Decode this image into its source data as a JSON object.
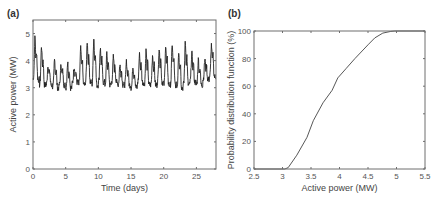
{
  "chart_data": [
    {
      "id": "a",
      "panel_label": "(a)",
      "type": "line",
      "title": "",
      "xlabel": "Time (days)",
      "ylabel": "Active power (MW)",
      "xlim": [
        0,
        28
      ],
      "ylim": [
        0,
        5.5
      ],
      "xticks": [
        0,
        5,
        10,
        15,
        20,
        25
      ],
      "xtick_labels": [
        "0",
        "5",
        "10",
        "15",
        "20",
        "25"
      ],
      "yticks": [
        0,
        1,
        2,
        3,
        4,
        5
      ],
      "ytick_labels": [
        "0",
        "1",
        "2",
        "3",
        "4",
        "5"
      ],
      "grid": false,
      "series": [
        {
          "name": "Active power",
          "description": "Daily cycle: per-day peak and trough values (MW)",
          "days": [
            0,
            1,
            2,
            3,
            4,
            5,
            6,
            7,
            8,
            9,
            10,
            11,
            12,
            13,
            14,
            15,
            16,
            17,
            18,
            19,
            20,
            21,
            22,
            23,
            24,
            25,
            26,
            27
          ],
          "daily_peak": [
            5.1,
            4.8,
            4.0,
            4.2,
            4.0,
            4.1,
            3.9,
            4.7,
            5.0,
            5.2,
            4.7,
            4.5,
            4.3,
            4.0,
            4.1,
            3.9,
            4.4,
            4.6,
            4.4,
            4.7,
            4.8,
            4.9,
            4.6,
            5.0,
            4.5,
            4.2,
            4.2,
            4.8
          ],
          "daily_trough": [
            3.3,
            3.1,
            3.1,
            3.0,
            3.1,
            3.0,
            3.2,
            3.1,
            3.2,
            3.1,
            3.2,
            3.1,
            3.2,
            3.1,
            3.1,
            3.0,
            3.2,
            3.1,
            3.1,
            3.2,
            3.1,
            3.1,
            3.0,
            3.1,
            3.2,
            3.1,
            3.3,
            3.4
          ]
        }
      ]
    },
    {
      "id": "b",
      "panel_label": "(b)",
      "type": "line",
      "title": "",
      "xlabel": "Active power (MW)",
      "ylabel": "Probability distribution function (%)",
      "xlim": [
        2.5,
        5.5
      ],
      "ylim": [
        0,
        100
      ],
      "xticks": [
        2.5,
        3,
        3.5,
        4,
        4.5,
        5,
        5.5
      ],
      "xtick_labels": [
        "2.5",
        "3",
        "3.5",
        "4",
        "4.5",
        "5",
        "5.5"
      ],
      "yticks": [
        0,
        20,
        40,
        60,
        80,
        100
      ],
      "ytick_labels": [
        "0",
        "20",
        "40",
        "60",
        "80",
        "100"
      ],
      "grid": false,
      "series": [
        {
          "name": "Cumulative distribution",
          "x": [
            2.5,
            3.04,
            3.1,
            3.25,
            3.43,
            3.54,
            3.71,
            3.87,
            3.97,
            4.12,
            4.27,
            4.5,
            4.62,
            4.76,
            4.9,
            4.97,
            5.5
          ],
          "y": [
            0,
            0,
            1,
            10,
            23,
            35,
            48,
            57,
            66,
            73,
            80,
            90,
            95,
            98.5,
            99.7,
            100,
            100
          ]
        }
      ]
    }
  ]
}
